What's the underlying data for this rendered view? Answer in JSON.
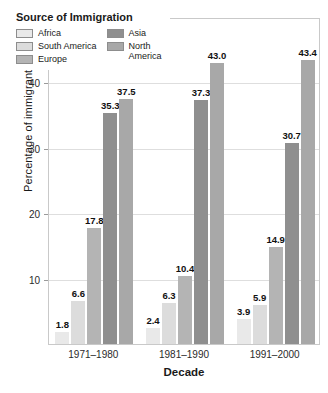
{
  "chart_data": {
    "type": "bar",
    "title": "",
    "xlabel": "Decade",
    "ylabel": "Percentage of immigrants",
    "categories": [
      "1971–1980",
      "1981–1990",
      "1991–2000"
    ],
    "series": [
      {
        "name": "Africa",
        "color": "#e9e9e9",
        "values": [
          1.8,
          2.4,
          3.9
        ]
      },
      {
        "name": "South America",
        "color": "#dcdcdc",
        "values": [
          6.6,
          6.3,
          5.9
        ]
      },
      {
        "name": "Europe",
        "color": "#b4b4b4",
        "values": [
          17.8,
          10.4,
          14.9
        ]
      },
      {
        "name": "Asia",
        "color": "#8f8f8f",
        "values": [
          35.3,
          37.3,
          30.7
        ]
      },
      {
        "name": "North America",
        "color": "#a8a8a8",
        "values": [
          37.5,
          43.0,
          43.4
        ]
      }
    ],
    "ylim": [
      0,
      50
    ],
    "yticks": [
      10,
      20,
      30,
      40,
      50
    ],
    "ytick_labels": [
      "10",
      "20",
      "30",
      "40",
      "50%"
    ],
    "grid": true,
    "legend_position": "top-left",
    "value_labels": true
  },
  "legend": {
    "title": "Source of Immigration",
    "column_left": [
      {
        "label": "Africa",
        "swatch_name": "legend-swatch-africa"
      },
      {
        "label": "South America",
        "swatch_name": "legend-swatch-south-america"
      },
      {
        "label": "Europe",
        "swatch_name": "legend-swatch-europe"
      }
    ],
    "column_right": [
      {
        "label": "Asia",
        "swatch_name": "legend-swatch-asia"
      },
      {
        "label": "North\nAmerica",
        "swatch_name": "legend-swatch-north-america"
      }
    ]
  },
  "axes": {
    "y_title": "Percentage of immigrants",
    "x_title": "Decade"
  }
}
